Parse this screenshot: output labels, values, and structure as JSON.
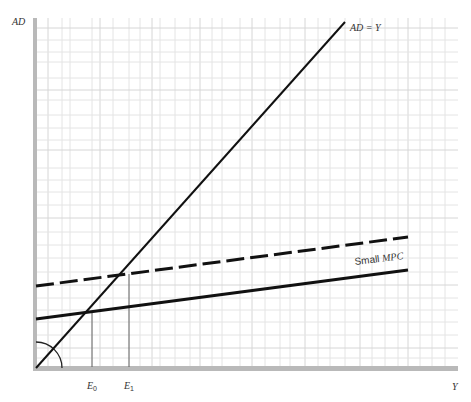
{
  "diagram": {
    "type": "Keynesian cross (aggregate demand vs. output)",
    "axes": {
      "y_label": "AD",
      "x_label": "Y",
      "color": "#b9b9b9"
    },
    "lines": [
      {
        "id": "ad-equals-y",
        "label": "AD = Y",
        "style": "solid",
        "color": "#111111",
        "description": "45-degree line"
      },
      {
        "id": "ad-small-mpc",
        "label": "Small MPC",
        "style": "solid",
        "color": "#111111",
        "description": "Original AD line with small marginal propensity to consume"
      },
      {
        "id": "ad-small-mpc-shifted",
        "label": "",
        "style": "dashed",
        "color": "#111111",
        "description": "AD line shifted upward"
      }
    ],
    "equilibria": [
      {
        "id": "E0",
        "label_main": "E",
        "label_sub": "0"
      },
      {
        "id": "E1",
        "label_main": "E",
        "label_sub": "1"
      }
    ],
    "annotations": {
      "angle_arc": "45-degree angle marker at origin"
    }
  },
  "labels": {
    "ad_axis": "AD",
    "y_axis": "Y",
    "ad_eq_y": "AD = Y",
    "small_mpc_word": "Small ",
    "small_mpc_italic": "MPC",
    "e0_main": "E",
    "e0_sub": "0",
    "e1_main": "E",
    "e1_sub": "1"
  }
}
